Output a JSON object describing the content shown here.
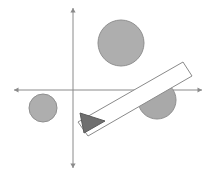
{
  "scene": {
    "title": "2D geometry scene with coordinate axes",
    "width": 216,
    "height": 175,
    "background_color": "#ffffff",
    "axes": {
      "label": "coordinate-axes",
      "color": "#8a8a8a",
      "stroke_width": 1,
      "origin": {
        "x": 73,
        "y": 90
      },
      "x_axis": {
        "label": "x-axis",
        "x1": 14,
        "y1": 90,
        "x2": 202,
        "y2": 90,
        "arrow_left": true,
        "arrow_right": true
      },
      "y_axis": {
        "label": "y-axis",
        "x1": 73,
        "y1": 8,
        "x2": 73,
        "y2": 168,
        "arrow_up": true,
        "arrow_down": true
      }
    },
    "shapes": [
      {
        "id": "circle-large-top",
        "name": "large-circle-upper-right-quadrant",
        "type": "circle",
        "cx": 121,
        "cy": 43,
        "r": 23,
        "fill": "#aeaeae",
        "stroke": "#8f8f8f",
        "quadrant": "I"
      },
      {
        "id": "circle-small-left",
        "name": "small-circle-lower-left-quadrant",
        "type": "circle",
        "cx": 43,
        "cy": 108,
        "r": 14,
        "fill": "#aeaeae",
        "stroke": "#8f8f8f",
        "quadrant": "III"
      },
      {
        "id": "circle-medium-right",
        "name": "medium-circle-on-x-axis",
        "type": "circle",
        "cx": 157,
        "cy": 100,
        "r": 19,
        "fill": "#a9a9a9",
        "stroke": "#8f8f8f",
        "quadrant": "IV"
      },
      {
        "id": "bar-ramp",
        "name": "tilted-rectangular-bar",
        "type": "rectangle",
        "fill": "#ffffff",
        "stroke": "#8a8a8a",
        "points": "78,122 183,62 192,76 88,136",
        "angle_deg": -30
      },
      {
        "id": "arrow-head",
        "name": "dark-triangle-arrowhead",
        "type": "triangle",
        "fill": "#6f6f6f",
        "stroke": "#5a5a5a",
        "points": "80,113 105,121 84,133"
      }
    ]
  }
}
